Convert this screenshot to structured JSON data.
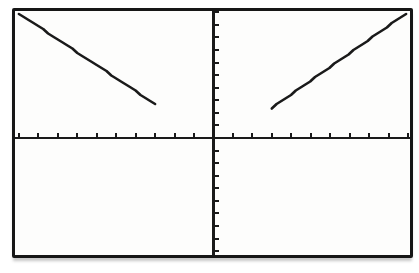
{
  "meta": {
    "page_background": "#ffffff",
    "screen_background": "#fdfdfc",
    "frame_border_color": "#161616",
    "plot_color": "#1a1a1a"
  },
  "chart_data": {
    "type": "line",
    "title": "",
    "xlabel": "",
    "ylabel": "",
    "grid": false,
    "legend": "none",
    "window": {
      "xmin": -10.2,
      "xmax": 10.1,
      "ymin": -9.3,
      "ymax": 10.1,
      "xscl": 1,
      "yscl": 1
    },
    "x_tick_values": [
      -10,
      -9,
      -8,
      -7,
      -6,
      -5,
      -4,
      -3,
      -2,
      -1,
      1,
      2,
      3,
      4,
      5,
      6,
      7,
      8,
      9,
      10
    ],
    "y_tick_values": [
      -10,
      -9,
      -8,
      -7,
      -6,
      -5,
      -4,
      -3,
      -2,
      -1,
      1,
      2,
      3,
      4,
      5,
      6,
      7,
      8,
      9,
      10
    ],
    "series": [
      {
        "name": "left-branch",
        "points": [
          [
            -10.0,
            9.9
          ],
          [
            -3.0,
            2.7
          ]
        ]
      },
      {
        "name": "right-branch",
        "points": [
          [
            3.0,
            2.4
          ],
          [
            9.9,
            9.9
          ]
        ]
      }
    ]
  }
}
